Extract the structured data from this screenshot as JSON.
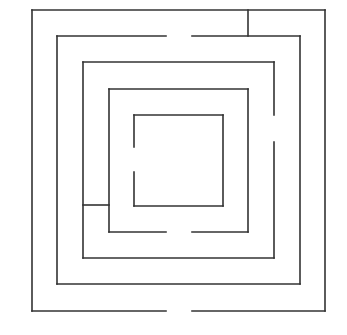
{
  "diagram": {
    "type": "maze",
    "shape": "concentric-square",
    "ring_count": 5,
    "wall_color": "#333333",
    "background_color": "#ffffff",
    "entrance": "bottom-center gap in outer wall",
    "rings": [
      {
        "ring": 1,
        "gap_side": "bottom"
      },
      {
        "ring": 2,
        "gap_side": "top"
      },
      {
        "ring": 3,
        "gap_side": "right"
      },
      {
        "ring": 4,
        "gap_side": "bottom"
      },
      {
        "ring": 5,
        "gap_side": "left"
      }
    ],
    "connectors": [
      {
        "between_rings": [
          1,
          2
        ],
        "side": "top-right"
      },
      {
        "between_rings": [
          3,
          4
        ],
        "side": "bottom-left"
      }
    ]
  }
}
